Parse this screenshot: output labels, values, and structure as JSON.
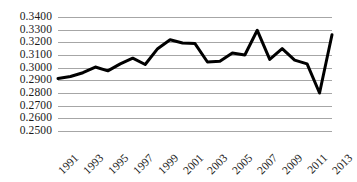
{
  "chart_data": {
    "type": "line",
    "title": "",
    "subtitle": "",
    "xlabel": "",
    "ylabel": "",
    "ylim": [
      0.25,
      0.34
    ],
    "xlim": [
      1991,
      2013
    ],
    "grid": true,
    "legend": false,
    "legend_position": "none",
    "y_tick_labels": [
      "0.3400",
      "0.3300",
      "0.3200",
      "0.3100",
      "0.3000",
      "0.2900",
      "0.2800",
      "0.2700",
      "0.2600",
      "0.2500"
    ],
    "y_tick_values": [
      0.34,
      0.33,
      0.32,
      0.31,
      0.3,
      0.29,
      0.28,
      0.27,
      0.26,
      0.25
    ],
    "x_tick_labels": [
      "1991",
      "1993",
      "1995",
      "1997",
      "1999",
      "2001",
      "2003",
      "2005",
      "2007",
      "2009",
      "2011",
      "2013"
    ],
    "x_tick_values": [
      1991,
      1993,
      1995,
      1997,
      1999,
      2001,
      2003,
      2005,
      2007,
      2009,
      2011,
      2013
    ],
    "x": [
      1991,
      1992,
      1993,
      1994,
      1995,
      1996,
      1997,
      1998,
      1999,
      2000,
      2001,
      2002,
      2003,
      2004,
      2005,
      2006,
      2007,
      2008,
      2009,
      2010,
      2011,
      2012,
      2013
    ],
    "categories": [
      "1991",
      "1992",
      "1993",
      "1994",
      "1995",
      "1996",
      "1997",
      "1998",
      "1999",
      "2000",
      "2001",
      "2002",
      "2003",
      "2004",
      "2005",
      "2006",
      "2007",
      "2008",
      "2009",
      "2010",
      "2011",
      "2012",
      "2013"
    ],
    "values": [
      0.2915,
      0.293,
      0.296,
      0.3005,
      0.2975,
      0.303,
      0.3075,
      0.3025,
      0.315,
      0.322,
      0.3195,
      0.319,
      0.3045,
      0.305,
      0.3115,
      0.31,
      0.3295,
      0.3065,
      0.315,
      0.306,
      0.303,
      0.28,
      0.326
    ],
    "series": [
      {
        "name": "series-1",
        "color": "#000000",
        "line_width": 3,
        "markers": false,
        "values": [
          0.2915,
          0.293,
          0.296,
          0.3005,
          0.2975,
          0.303,
          0.3075,
          0.3025,
          0.315,
          0.322,
          0.3195,
          0.319,
          0.3045,
          0.305,
          0.3115,
          0.31,
          0.3295,
          0.3065,
          0.315,
          0.306,
          0.303,
          0.28,
          0.326
        ]
      }
    ],
    "colors": {
      "line": "#000000",
      "gridline": "#a6a6a6",
      "background": "#ffffff",
      "text": "#1a1a1a"
    }
  }
}
